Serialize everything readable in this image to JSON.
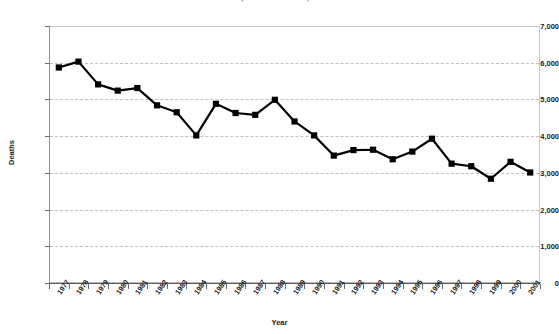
{
  "chart_data": {
    "type": "line",
    "title": "DEATHS, UNITED STATES, 1977-2001",
    "xlabel": "Year",
    "ylabel": "Deaths",
    "categories": [
      "1977",
      "1978",
      "1979",
      "1980",
      "1981",
      "1982",
      "1983",
      "1984",
      "1985",
      "1986",
      "1987",
      "1988",
      "1989",
      "1990",
      "1991",
      "1992",
      "1993",
      "1994",
      "1995",
      "1996",
      "1997",
      "1998",
      "1999",
      "2000",
      "2001"
    ],
    "values": [
      5870,
      6030,
      5410,
      5240,
      5310,
      4840,
      4650,
      4020,
      4880,
      4630,
      4580,
      4990,
      4400,
      4020,
      3470,
      3620,
      3630,
      3370,
      3580,
      3930,
      3250,
      3180,
      2840,
      3300,
      3010
    ],
    "series": [
      {
        "name": "Deaths",
        "values": [
          5870,
          6030,
          5410,
          5240,
          5310,
          4840,
          4650,
          4020,
          4880,
          4630,
          4580,
          4990,
          4400,
          4020,
          3470,
          3620,
          3630,
          3370,
          3580,
          3930,
          3250,
          3180,
          2840,
          3300,
          3010
        ]
      }
    ],
    "ylim": [
      0,
      7000
    ],
    "ytick_labels": [
      "0",
      "1,000",
      "2,000",
      "3,000",
      "4,000",
      "5,000",
      "6,000",
      "7,000"
    ],
    "ytick_values": [
      0,
      1000,
      2000,
      3000,
      4000,
      5000,
      6000,
      7000
    ],
    "grid": true,
    "grid_style": "dashed-horizontal",
    "legend": "none",
    "marker": "square",
    "marker_color": "#000000",
    "line_color": "#000000",
    "grid_color": "#c2c2c2",
    "axis_color": "#6b6b6b",
    "background_color": "#ffffff"
  }
}
